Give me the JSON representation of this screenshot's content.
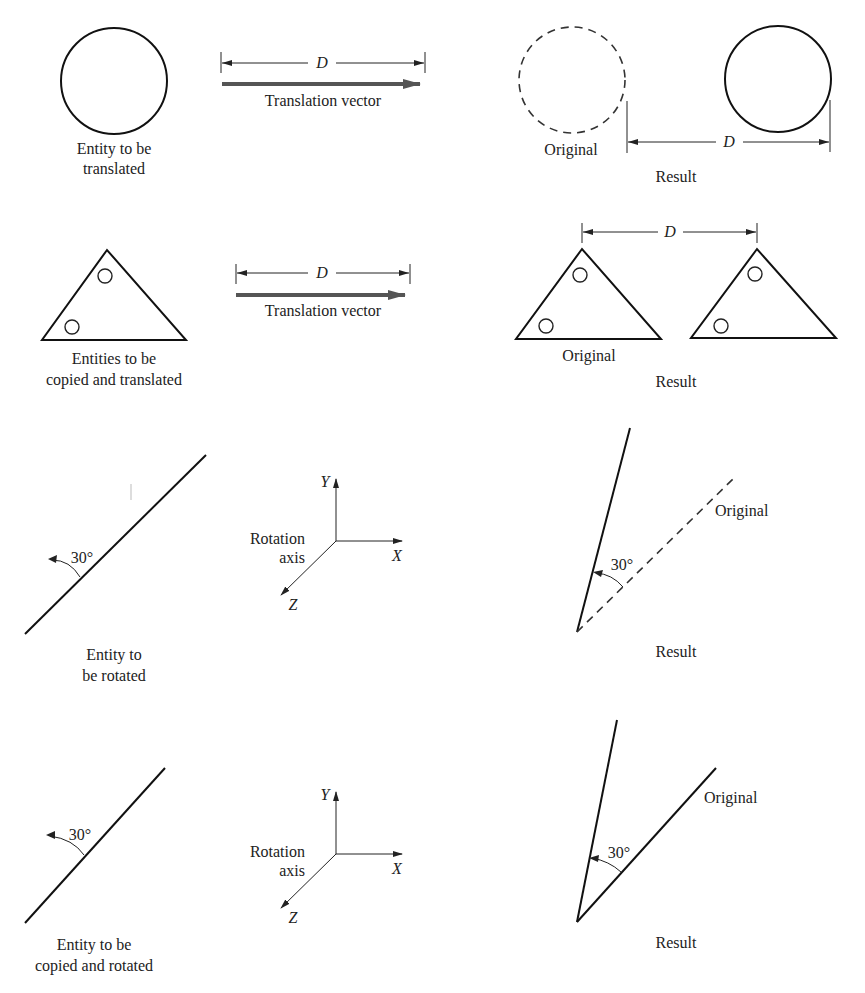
{
  "figure": {
    "rows": [
      {
        "id": "translate",
        "entity_label": [
          "Entity to be",
          "translated"
        ],
        "dimension_label": "D",
        "vector_label": "Translation vector",
        "original_label": "Original",
        "result_label": "Result"
      },
      {
        "id": "copy-translate",
        "entity_label": [
          "Entities to be",
          "copied and translated"
        ],
        "dimension_label": "D",
        "vector_label": "Translation vector",
        "original_label": "Original",
        "result_label": "Result"
      },
      {
        "id": "rotate",
        "entity_label": [
          "Entity to",
          "be rotated"
        ],
        "angle_label": "30°",
        "axis_label": [
          "Rotation",
          "axis"
        ],
        "axes": {
          "x": "X",
          "y": "Y",
          "z": "Z"
        },
        "original_label": "Original",
        "result_label": "Result"
      },
      {
        "id": "copy-rotate",
        "entity_label": [
          "Entity to be",
          "copied and rotated"
        ],
        "angle_label": "30°",
        "axis_label": [
          "Rotation",
          "axis"
        ],
        "axes": {
          "x": "X",
          "y": "Y",
          "z": "Z"
        },
        "original_label": "Original",
        "result_label": "Result"
      }
    ]
  }
}
